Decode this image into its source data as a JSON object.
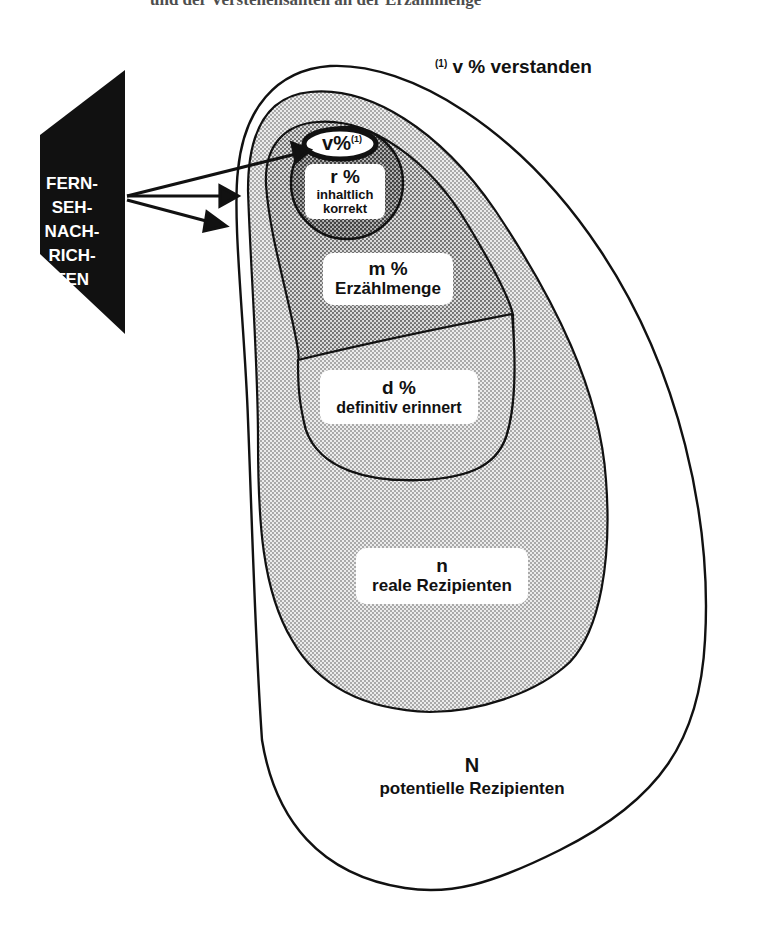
{
  "header_fragment": "und der Verstehensanteil an der Erzählmenge",
  "source": {
    "lines": [
      "FERN-",
      "SEH-",
      "NACH-",
      "RICH-",
      "TEN"
    ]
  },
  "footnote": {
    "marker": "(1)",
    "text": "v % verstanden"
  },
  "sets": {
    "v": {
      "symbol": "v%",
      "marker": "(1)"
    },
    "r": {
      "symbol": "r %",
      "line1": "inhaltlich",
      "line2": "korrekt"
    },
    "m": {
      "symbol": "m %",
      "label": "Erzählmenge"
    },
    "d": {
      "symbol": "d %",
      "label": "definitiv erinnert"
    },
    "n": {
      "symbol": "n",
      "label": "reale Rezipienten"
    },
    "N": {
      "symbol": "N",
      "label": "potentielle Rezipienten"
    }
  },
  "colors": {
    "outline": "#111111",
    "tv_block": "#111111",
    "n_fill": "#d9d9d9",
    "m_fill": "#b8b8b8",
    "d_fill": "#cfcfcf",
    "r_fill": "#a6a6a6",
    "label_bg": "#ffffff"
  }
}
